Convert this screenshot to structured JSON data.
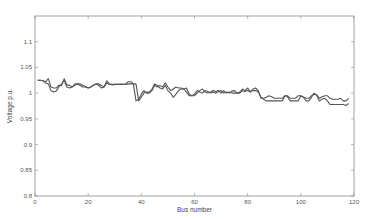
{
  "chart_data": {
    "type": "line",
    "title": "",
    "xlabel": "Bus number",
    "ylabel": "Voltage p.u.",
    "xlim": [
      0,
      120
    ],
    "ylim": [
      0.8,
      1.15
    ],
    "xticks": [
      0,
      20,
      40,
      60,
      80,
      100,
      120
    ],
    "xtick_labels": [
      "0",
      "20",
      "40",
      "60",
      "80",
      "100",
      "120"
    ],
    "yticks": [
      0.8,
      0.85,
      0.9,
      0.95,
      1,
      1.05,
      1.1
    ],
    "ytick_labels": [
      "0.8",
      "0.85",
      "0.9",
      "0.95",
      "1",
      "1.05",
      "1.1"
    ],
    "grid": false,
    "legend": null,
    "line_color": "#555555",
    "series": [
      {
        "name": "Series 1",
        "x": [
          1,
          2,
          3,
          4,
          5,
          6,
          7,
          8,
          9,
          10,
          11,
          12,
          13,
          14,
          15,
          16,
          17,
          18,
          19,
          20,
          21,
          22,
          23,
          24,
          25,
          26,
          27,
          28,
          29,
          30,
          31,
          32,
          33,
          34,
          35,
          36,
          37,
          38,
          39,
          40,
          41,
          42,
          43,
          44,
          45,
          46,
          47,
          48,
          49,
          50,
          51,
          52,
          53,
          54,
          55,
          56,
          57,
          58,
          59,
          60,
          61,
          62,
          63,
          64,
          65,
          66,
          67,
          68,
          69,
          70,
          71,
          72,
          73,
          74,
          75,
          76,
          77,
          78,
          79,
          80,
          81,
          82,
          83,
          84,
          85,
          86,
          87,
          88,
          89,
          90,
          91,
          92,
          93,
          94,
          95,
          96,
          97,
          98,
          99,
          100,
          101,
          102,
          103,
          104,
          105,
          106,
          107,
          108,
          109,
          110,
          111,
          112,
          113,
          114,
          115,
          116,
          117,
          118
        ],
        "values": [
          1.025,
          1.025,
          1.024,
          1.022,
          1.028,
          1.012,
          1.01,
          1.01,
          1.015,
          1.015,
          1.028,
          1.016,
          1.015,
          1.012,
          1.015,
          1.018,
          1.018,
          1.015,
          1.013,
          1.01,
          1.012,
          1.016,
          1.018,
          1.018,
          1.015,
          1.012,
          1.02,
          1.017,
          1.017,
          1.017,
          1.017,
          1.017,
          1.017,
          1.017,
          1.022,
          1.022,
          1.018,
          0.985,
          0.988,
          0.998,
          1.005,
          1.0,
          1.0,
          1.005,
          1.015,
          1.012,
          1.015,
          1.012,
          1.02,
          1.012,
          1.005,
          1.008,
          1.012,
          1.01,
          1.01,
          1.008,
          1.002,
          0.995,
          0.995,
          0.995,
          1.0,
          1.005,
          1.008,
          1.002,
          1.0,
          1.002,
          1.005,
          1.003,
          1.005,
          1.0,
          1.005,
          1.0,
          1.002,
          1.0,
          1.0,
          1.0,
          1.0,
          1.005,
          1.003,
          1.005,
          1.002,
          1.008,
          1.01,
          1.005,
          0.99,
          0.99,
          0.992,
          0.995,
          0.993,
          0.99,
          0.99,
          0.99,
          0.99,
          0.995,
          0.995,
          0.99,
          0.99,
          0.99,
          0.995,
          0.995,
          0.992,
          0.99,
          0.99,
          0.995,
          0.998,
          0.997,
          0.99,
          0.993,
          0.995,
          0.995,
          0.99,
          0.988,
          0.988,
          0.988,
          0.99,
          0.985,
          0.985,
          0.99
        ]
      },
      {
        "name": "Series 2",
        "x": [
          1,
          2,
          3,
          4,
          5,
          6,
          7,
          8,
          9,
          10,
          11,
          12,
          13,
          14,
          15,
          16,
          17,
          18,
          19,
          20,
          21,
          22,
          23,
          24,
          25,
          26,
          27,
          28,
          29,
          30,
          31,
          32,
          33,
          34,
          35,
          36,
          37,
          38,
          39,
          40,
          41,
          42,
          43,
          44,
          45,
          46,
          47,
          48,
          49,
          50,
          51,
          52,
          53,
          54,
          55,
          56,
          57,
          58,
          59,
          60,
          61,
          62,
          63,
          64,
          65,
          66,
          67,
          68,
          69,
          70,
          71,
          72,
          73,
          74,
          75,
          76,
          77,
          78,
          79,
          80,
          81,
          82,
          83,
          84,
          85,
          86,
          87,
          88,
          89,
          90,
          91,
          92,
          93,
          94,
          95,
          96,
          97,
          98,
          99,
          100,
          101,
          102,
          103,
          104,
          105,
          106,
          107,
          108,
          109,
          110,
          111,
          112,
          113,
          114,
          115,
          116,
          117,
          118
        ],
        "values": [
          1.025,
          1.025,
          1.024,
          1.02,
          1.018,
          1.005,
          1.002,
          1.004,
          1.012,
          1.018,
          1.025,
          1.012,
          1.01,
          1.012,
          1.018,
          1.018,
          1.015,
          1.012,
          1.012,
          1.01,
          1.012,
          1.015,
          1.018,
          1.015,
          1.01,
          1.012,
          1.024,
          1.018,
          1.016,
          1.017,
          1.017,
          1.017,
          1.017,
          1.017,
          1.018,
          1.018,
          1.018,
          1.018,
          0.985,
          0.992,
          1.0,
          1.002,
          1.002,
          1.008,
          1.018,
          1.015,
          1.01,
          1.008,
          1.015,
          1.005,
          1.0,
          0.992,
          0.998,
          1.005,
          1.008,
          1.008,
          1.01,
          0.998,
          0.995,
          0.998,
          1.005,
          1.002,
          1.0,
          1.005,
          1.003,
          1.0,
          1.002,
          1.0,
          1.003,
          1.005,
          1.0,
          1.002,
          1.0,
          1.004,
          1.005,
          1.0,
          1.002,
          1.008,
          1.005,
          1.01,
          1.003,
          1.005,
          1.005,
          1.002,
          0.992,
          0.988,
          0.985,
          0.985,
          0.985,
          0.985,
          0.985,
          0.985,
          0.985,
          0.995,
          0.993,
          0.985,
          0.985,
          0.985,
          0.985,
          0.995,
          0.992,
          0.985,
          0.985,
          0.992,
          1.0,
          0.995,
          0.985,
          0.988,
          0.99,
          0.985,
          0.978,
          0.978,
          0.978,
          0.978,
          0.978,
          0.978,
          0.976,
          0.98
        ]
      }
    ]
  }
}
